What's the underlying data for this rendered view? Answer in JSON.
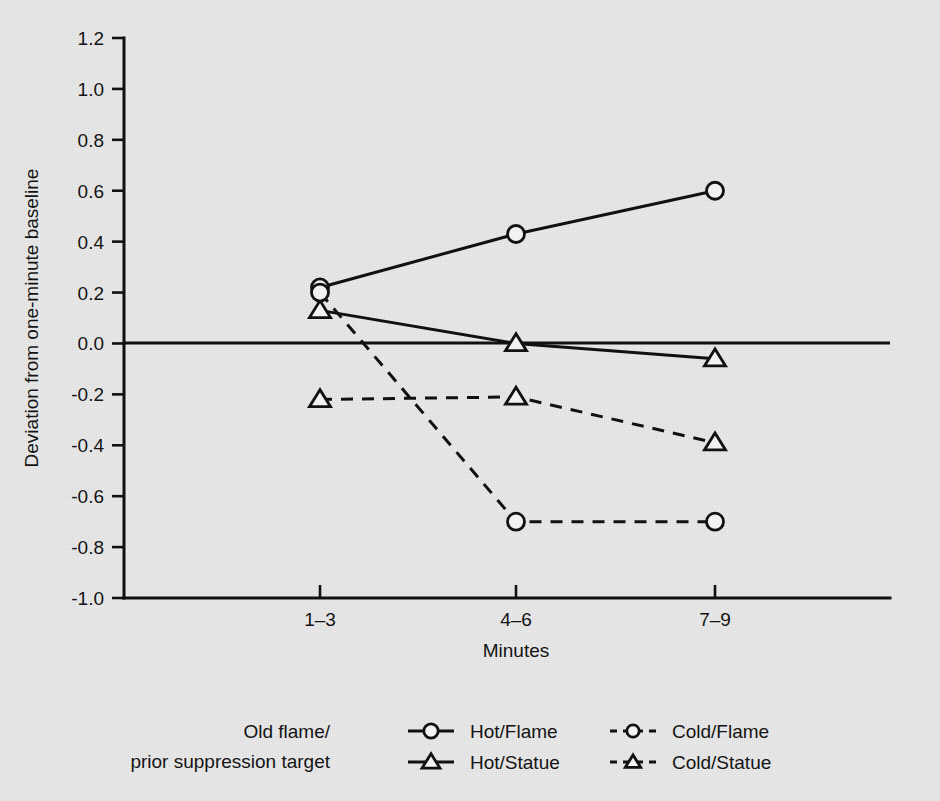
{
  "chart_data": {
    "type": "line",
    "title": "",
    "xlabel": "Minutes",
    "ylabel": "Deviation from one-minute baseline",
    "categories": [
      "1–3",
      "4–6",
      "7–9"
    ],
    "ylim": [
      -1.0,
      1.2
    ],
    "yticks": [
      "1.2",
      "1.0",
      "0.8",
      "0.6",
      "0.4",
      "0.2",
      "0.0",
      "-0.2",
      "-0.4",
      "-0.6",
      "-0.8",
      "-1.0"
    ],
    "ytick_values": [
      1.2,
      1.0,
      0.8,
      0.6,
      0.4,
      0.2,
      0.0,
      -0.2,
      -0.4,
      -0.6,
      -0.8,
      -1.0
    ],
    "grid": false,
    "zero_reference_line": 0.0,
    "legend_position": "bottom",
    "series": [
      {
        "name": "Hot/Flame",
        "marker": "circle",
        "linestyle": "solid",
        "values": [
          0.22,
          0.43,
          0.6
        ]
      },
      {
        "name": "Hot/Statue",
        "marker": "triangle",
        "linestyle": "solid",
        "values": [
          0.13,
          0.0,
          -0.06
        ]
      },
      {
        "name": "Cold/Flame",
        "marker": "circle",
        "linestyle": "dashed",
        "values": [
          0.2,
          -0.7,
          -0.7
        ]
      },
      {
        "name": "Cold/Statue",
        "marker": "triangle",
        "linestyle": "dashed",
        "values": [
          -0.22,
          -0.21,
          -0.39
        ]
      }
    ]
  },
  "legend": {
    "group_label_line1": "Old flame/",
    "group_label_line2": "prior suppression target",
    "entries": [
      {
        "label": "Hot/Flame",
        "marker": "circle",
        "linestyle": "solid"
      },
      {
        "label": "Cold/Flame",
        "marker": "circle",
        "linestyle": "dashed"
      },
      {
        "label": "Hot/Statue",
        "marker": "triangle",
        "linestyle": "solid"
      },
      {
        "label": "Cold/Statue",
        "marker": "triangle",
        "linestyle": "dashed"
      }
    ]
  },
  "axes": {
    "x_title": "Minutes",
    "y_title": "Deviation from one-minute baseline",
    "x_tick_labels": [
      "1–3",
      "4–6",
      "7–9"
    ],
    "y_tick_labels": [
      "1.2",
      "1.0",
      "0.8",
      "0.6",
      "0.4",
      "0.2",
      "0.0",
      "-0.2",
      "-0.4",
      "-0.6",
      "-0.8",
      "-1.0"
    ]
  },
  "colors": {
    "background": "#e9e9e9",
    "ink": "#111111",
    "marker_fill": "#f2f2f2"
  }
}
